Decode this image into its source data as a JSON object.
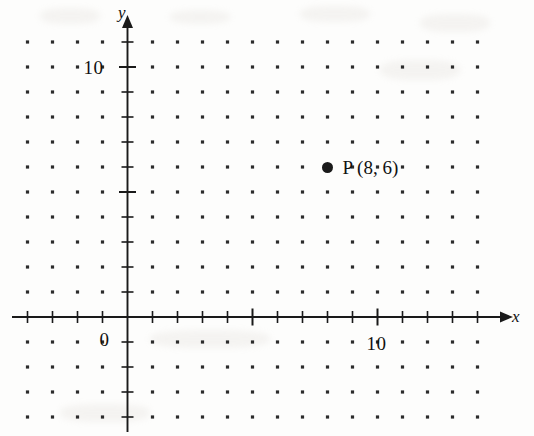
{
  "figure": {
    "kind": "coordinate-plane",
    "background_color": "#fdfdfc",
    "ink_color": "#1a1a1a",
    "axes": {
      "x_label": "x",
      "y_label": "y",
      "origin_label": "0",
      "x_tick_label": "10",
      "y_tick_label": "10"
    },
    "point": {
      "label": "P (8, 6)",
      "name": "P",
      "x": 8,
      "y": 6
    }
  },
  "chart_data": {
    "type": "scatter",
    "title": "",
    "xlabel": "x",
    "ylabel": "y",
    "grid": true,
    "grid_style": "lattice-dots",
    "grid_spacing": 1,
    "legend": "none",
    "xlim": [
      -4,
      15
    ],
    "ylim": [
      -4,
      11
    ],
    "xticks": [
      0,
      10
    ],
    "xtick_labels": [
      "0",
      "10"
    ],
    "yticks": [
      0,
      10
    ],
    "ytick_labels": [
      "0",
      "10"
    ],
    "points": [
      {
        "label": "P (8, 6)",
        "x": 8,
        "y": 6
      }
    ],
    "series": [
      {
        "name": "P",
        "x": [
          8
        ],
        "y": [
          6
        ],
        "labels": [
          "P (8, 6)"
        ]
      }
    ]
  }
}
